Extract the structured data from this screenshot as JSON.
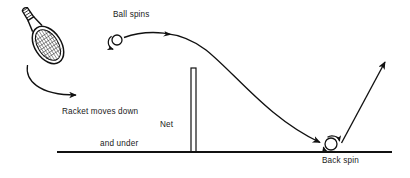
{
  "figure": {
    "stroke_color": "#111111",
    "background_color": "#ffffff",
    "width": 410,
    "height": 178
  },
  "labels": {
    "ball_spins": "Ball spins",
    "racket_moves_line1": "Racket moves down",
    "racket_moves_line2": "and under",
    "net": "Net",
    "back_spin": "Back spin"
  },
  "elements": {
    "racket": {
      "name": "racket",
      "head_center_x": 48,
      "head_center_y": 45,
      "head_rx": 13,
      "head_ry": 20,
      "tilt_degrees": 35,
      "handle_end_x": 80,
      "handle_end_y": 16
    },
    "swing_arrow": {
      "name": "racket-swing-arrow",
      "start_x": 28,
      "start_y": 66,
      "end_x": 83,
      "end_y": 95,
      "direction": "down-and-under"
    },
    "ball_top": {
      "name": "ball-at-contact",
      "center_x": 117,
      "center_y": 40,
      "radius": 5,
      "spin_direction": "backspin"
    },
    "trajectory": {
      "name": "ball-flight-path",
      "start_x": 124,
      "start_y": 37,
      "apex_x": 186,
      "apex_y": 34,
      "end_x": 322,
      "end_y": 143,
      "mid_arrowhead_x": 170,
      "mid_arrowhead_y": 37
    },
    "net": {
      "name": "net",
      "x": 191,
      "top_y": 68,
      "bottom_y": 152,
      "width": 5
    },
    "ground": {
      "name": "ground-line",
      "start_x": 57,
      "end_x": 392,
      "y": 152
    },
    "ball_bounce": {
      "name": "ball-after-bounce",
      "center_x": 331,
      "center_y": 144,
      "radius": 6,
      "spin_direction": "backspin"
    },
    "rebound_arrow": {
      "name": "rebound-arrow",
      "start_x": 341,
      "start_y": 143,
      "end_x": 386,
      "end_y": 56,
      "direction": "up"
    }
  }
}
